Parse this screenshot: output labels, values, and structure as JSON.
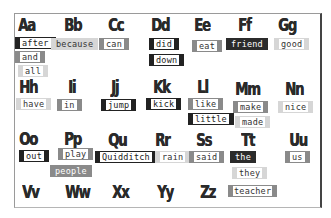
{
  "alphabet": [
    {
      "letter": "Aa",
      "words": [
        "after",
        "and",
        "all"
      ]
    },
    {
      "letter": "Bb",
      "words": [
        "because"
      ]
    },
    {
      "letter": "Cc",
      "words": [
        "can"
      ]
    },
    {
      "letter": "Dd",
      "words": [
        "did",
        "down"
      ]
    },
    {
      "letter": "Ee",
      "words": [
        "eat"
      ]
    },
    {
      "letter": "Ff",
      "words": [
        "friend"
      ]
    },
    {
      "letter": "Gg",
      "words": [
        "good"
      ]
    },
    {
      "letter": "Hh",
      "words": [
        "have"
      ]
    },
    {
      "letter": "Ii",
      "words": [
        "in"
      ]
    },
    {
      "letter": "Jj",
      "words": [
        "jump"
      ]
    },
    {
      "letter": "Kk",
      "words": [
        "kick"
      ]
    },
    {
      "letter": "Ll",
      "words": [
        "like",
        "little"
      ]
    },
    {
      "letter": "Mm",
      "words": [
        "make",
        "made"
      ]
    },
    {
      "letter": "Nn",
      "words": [
        "nice"
      ]
    },
    {
      "letter": "Oo",
      "words": [
        "out"
      ]
    },
    {
      "letter": "Pp",
      "words": [
        "play",
        "people"
      ]
    },
    {
      "letter": "Qu",
      "words": [
        "Quidditch"
      ]
    },
    {
      "letter": "Rr",
      "words": [
        "rain"
      ]
    },
    {
      "letter": "Ss",
      "words": [
        "said"
      ]
    },
    {
      "letter": "Tt",
      "words": [
        "the",
        "they",
        "teacher"
      ]
    },
    {
      "letter": "Uu",
      "words": [
        "us"
      ]
    },
    {
      "letter": "Vv",
      "words": []
    },
    {
      "letter": "Ww",
      "words": []
    },
    {
      "letter": "Xx",
      "words": []
    },
    {
      "letter": "Yy",
      "words": []
    },
    {
      "letter": "Zz",
      "words": []
    }
  ],
  "colors": {
    "dark": "#222222",
    "mid": "#8a8a8a",
    "light": "#d6d6d6",
    "frame": "#444444"
  }
}
